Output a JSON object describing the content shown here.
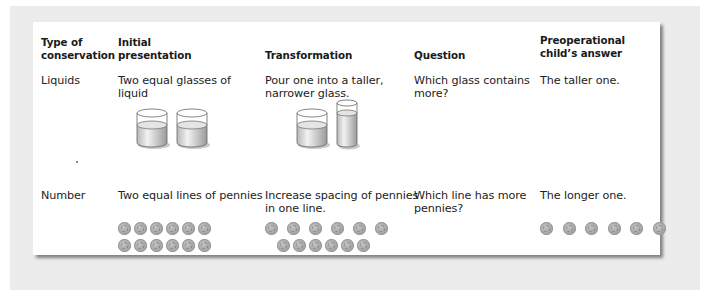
{
  "table": {
    "headers": [
      {
        "line1": "Type of",
        "line2": "conservation"
      },
      {
        "line1": "Initial",
        "line2": "presentation"
      },
      {
        "line1": "",
        "line2": "Transformation"
      },
      {
        "line1": "",
        "line2": "Question"
      },
      {
        "line1": "Preoperational",
        "line2": "child’s answer"
      }
    ],
    "rows": [
      {
        "type": "Liquids",
        "initial": {
          "line1": "Two equal glasses of",
          "line2": "liquid"
        },
        "transformation": {
          "line1": "Pour one into a taller,",
          "line2": "narrower glass."
        },
        "question": {
          "line1": "Which glass contains",
          "line2": "more?"
        },
        "answer": "The taller one.",
        "illustrations": {
          "initial": [
            "glass-short",
            "glass-short"
          ],
          "transformation": [
            "glass-short",
            "glass-tall"
          ]
        }
      },
      {
        "type": "Number",
        "initial": {
          "line1": "Two equal lines of pennies",
          "line2": ""
        },
        "transformation": {
          "line1": "Increase spacing of pennies",
          "line2": "in one line."
        },
        "question": {
          "line1": "Which line has more",
          "line2": "pennies?"
        },
        "answer": "The longer one.",
        "illustrations": {
          "initial": {
            "row1_count": 6,
            "row2_count": 6
          },
          "transformation": {
            "row1_count": 6,
            "row1_spacing": "wide",
            "row2_count": 6,
            "row2_spacing": "tight"
          },
          "answer": {
            "row1_count": 6,
            "row1_spacing": "wide"
          }
        }
      }
    ]
  },
  "colors": {
    "frame": "#ececec",
    "card": "#ffffff",
    "text": "#222222",
    "penny": "#a8a8a8",
    "liquid": "#d9d9d9"
  }
}
